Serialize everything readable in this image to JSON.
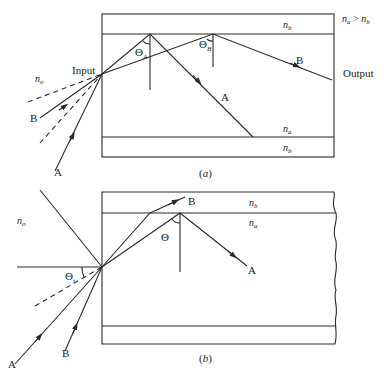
{
  "figure_a": {
    "caption": "(a)",
    "condition": "n_a > n_b",
    "condition_parts": {
      "n": "n",
      "a": "a",
      "gt": " > ",
      "b": "b"
    },
    "labels": {
      "n_o": {
        "base": "n",
        "sub": "o"
      },
      "n_b_top": {
        "base": "n",
        "sub": "b"
      },
      "n_a_bottom": {
        "base": "n",
        "sub": "a"
      },
      "n_b_bottom": {
        "base": "n",
        "sub": "b"
      },
      "input": "Input",
      "output": "Output",
      "theta_A": {
        "base": "Θ",
        "sub": "A"
      },
      "theta_B": {
        "base": "Θ",
        "sub": "B"
      },
      "ray_A_incident": "A",
      "ray_B_incident": "B",
      "ray_A_guided": "A",
      "ray_B_guided": "B"
    }
  },
  "figure_b": {
    "caption": "(b)",
    "labels": {
      "n_o": {
        "base": "n",
        "sub": "o"
      },
      "n_b": {
        "base": "n",
        "sub": "b"
      },
      "n_a": {
        "base": "n",
        "sub": "a"
      },
      "theta_i": {
        "base": "Θ",
        "sub": "i"
      },
      "theta": "Θ",
      "ray_A_incident": "A",
      "ray_B_incident": "B",
      "ray_A_guided": "A",
      "ray_B_escaping": "B"
    }
  }
}
